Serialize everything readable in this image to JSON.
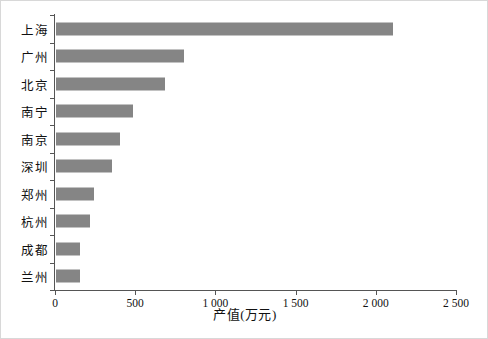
{
  "chart_data": {
    "type": "bar",
    "orientation": "horizontal",
    "title": "",
    "xlabel": "产值(万元)",
    "ylabel": "",
    "categories": [
      "上海",
      "广州",
      "北京",
      "南宁",
      "南京",
      "深圳",
      "郑州",
      "杭州",
      "成都",
      "兰州"
    ],
    "values": [
      2100,
      800,
      680,
      480,
      400,
      350,
      240,
      210,
      150,
      150
    ],
    "xlim": [
      0,
      2500
    ],
    "xticks": [
      0,
      500,
      1000,
      1500,
      2000,
      2500
    ],
    "xtick_labels": [
      "0",
      "500",
      "1 000",
      "1 500",
      "2 000",
      "2 500"
    ],
    "grid": false,
    "legend": false,
    "bar_color": "#858585",
    "axis_color": "#555555",
    "frame_color": "#d8d8d8"
  }
}
